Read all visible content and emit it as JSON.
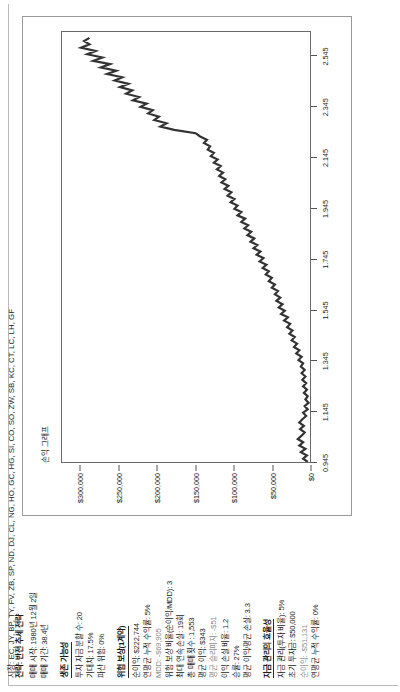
{
  "report": {
    "strategy_title": "전략: 반전 추세 전략",
    "start_line": "매매 시작: 1980년 12월 2일",
    "period_line": "매매 기간: 38.4년",
    "markets_line": "시장: EC, JY, BP, TY, FV, ZB, SP, ND, DJ, CL, NG, HO, GC, HG, SI, CO, SO, ZW, SB, KC, CT, LC, LH, GF",
    "sections": [
      {
        "heading": "생존 가능성",
        "rows": [
          {
            "text": "투자 자금 분할 수: 20",
            "muted": false
          },
          {
            "text": "기대치: 17.5%",
            "muted": false
          },
          {
            "text": "파산 위험: 0%",
            "muted": false
          }
        ]
      },
      {
        "heading": "위험 보상(1계약)",
        "rows": [
          {
            "text": "순이익: $222,744",
            "muted": false
          },
          {
            "text": "연평균 누적 수익률: 5%",
            "muted": false
          },
          {
            "text": "MDD: -$69,905",
            "muted": true
          },
          {
            "text": "위험 보상 비율(순이익/MDD): 3",
            "muted": false
          },
          {
            "text": "최대 연속 손실: 19회",
            "muted": false
          },
          {
            "text": "총 매매 횟수: 1,553",
            "muted": false
          },
          {
            "text": "평균 이익: $343",
            "muted": false
          },
          {
            "text": "평균 슬리피지: -$51",
            "muted": true
          },
          {
            "text": "이익 손실 비율: 1.2",
            "muted": false
          },
          {
            "text": "승률: 27%",
            "muted": false
          },
          {
            "text": "평균 이익/평균 손실: 3.3",
            "muted": false
          }
        ]
      },
      {
        "heading": "자금 관리의 효율성",
        "rows": [
          {
            "text": "자금 관리(투자 비율): 5%",
            "muted": false
          },
          {
            "text": "초기 투자금: $50,000",
            "muted": false
          },
          {
            "text": "순이익: -$51,131",
            "muted": true
          },
          {
            "text": "연평균 누적 수익률: 0%",
            "muted": false
          }
        ]
      }
    ]
  },
  "chart_data": {
    "type": "line",
    "title": "손익 그래프",
    "xlabel": "",
    "ylabel": "",
    "grid": false,
    "legend": "none",
    "line_color": "#333333",
    "xlim": [
      0.945,
      2.645
    ],
    "ylim": [
      0,
      325000
    ],
    "xticks": [
      "0.945",
      "1.145",
      "1.345",
      "1.545",
      "1.745",
      "1.945",
      "2.145",
      "2.345",
      "2.545"
    ],
    "xtick_values": [
      0.945,
      1.145,
      1.345,
      1.545,
      1.745,
      1.945,
      2.145,
      2.345,
      2.545
    ],
    "yticks": [
      "$0",
      "$50,000",
      "$100,000",
      "$150,000",
      "$200,000",
      "$250,000",
      "$300,000"
    ],
    "ytick_values": [
      0,
      50000,
      100000,
      150000,
      200000,
      250000,
      300000
    ],
    "series": [
      {
        "name": "누적 손익",
        "x": [
          0.945,
          0.958,
          0.971,
          0.984,
          0.997,
          1.01,
          1.023,
          1.036,
          1.049,
          1.062,
          1.075,
          1.088,
          1.101,
          1.114,
          1.127,
          1.14,
          1.153,
          1.166,
          1.179,
          1.192,
          1.205,
          1.218,
          1.231,
          1.244,
          1.257,
          1.27,
          1.283,
          1.296,
          1.309,
          1.322,
          1.335,
          1.348,
          1.361,
          1.374,
          1.387,
          1.4,
          1.413,
          1.426,
          1.439,
          1.452,
          1.465,
          1.478,
          1.491,
          1.504,
          1.517,
          1.53,
          1.543,
          1.556,
          1.569,
          1.582,
          1.595,
          1.608,
          1.621,
          1.634,
          1.647,
          1.66,
          1.673,
          1.686,
          1.699,
          1.712,
          1.725,
          1.738,
          1.751,
          1.764,
          1.777,
          1.79,
          1.803,
          1.816,
          1.829,
          1.842,
          1.855,
          1.868,
          1.881,
          1.894,
          1.907,
          1.92,
          1.933,
          1.946,
          1.959,
          1.972,
          1.985,
          1.998,
          2.011,
          2.024,
          2.037,
          2.05,
          2.063,
          2.076,
          2.089,
          2.102,
          2.115,
          2.128,
          2.141,
          2.154,
          2.167,
          2.18,
          2.193,
          2.206,
          2.219,
          2.232,
          2.245,
          2.258,
          2.271,
          2.284,
          2.297,
          2.31,
          2.323,
          2.336,
          2.349,
          2.362,
          2.375,
          2.388,
          2.401,
          2.414,
          2.427,
          2.44,
          2.453,
          2.466,
          2.479,
          2.492,
          2.505,
          2.518,
          2.531,
          2.544,
          2.557,
          2.57,
          2.583,
          2.596,
          2.609,
          2.622
        ],
        "values": [
          3000,
          9000,
          4000,
          12000,
          6000,
          14000,
          9000,
          16000,
          11000,
          7000,
          13000,
          8000,
          14000,
          10000,
          5000,
          9000,
          3000,
          7000,
          2000,
          6000,
          3000,
          8000,
          4000,
          9000,
          5000,
          10000,
          6000,
          11000,
          7000,
          12000,
          9000,
          15000,
          11000,
          18000,
          14000,
          21000,
          17000,
          24000,
          20000,
          27000,
          23000,
          30000,
          26000,
          34000,
          29000,
          38000,
          33000,
          41000,
          36000,
          44000,
          39000,
          46000,
          42000,
          50000,
          46000,
          54000,
          50000,
          58000,
          54000,
          62000,
          57000,
          66000,
          61000,
          70000,
          65000,
          74000,
          69000,
          78000,
          73000,
          82000,
          77000,
          86000,
          81000,
          90000,
          85000,
          95000,
          90000,
          99000,
          95000,
          104000,
          99000,
          108000,
          103000,
          112000,
          107000,
          116000,
          111000,
          119000,
          114000,
          122000,
          117000,
          126000,
          121000,
          130000,
          126000,
          134000,
          131000,
          139000,
          135000,
          144000,
          150000,
          178000,
          196000,
          188000,
          204000,
          198000,
          212000,
          206000,
          222000,
          214000,
          232000,
          224000,
          241000,
          233000,
          249000,
          238000,
          256000,
          246000,
          266000,
          254000,
          274000,
          262000,
          284000,
          272000,
          292000,
          281000,
          300000,
          289000,
          296000,
          289000
        ]
      }
    ]
  }
}
